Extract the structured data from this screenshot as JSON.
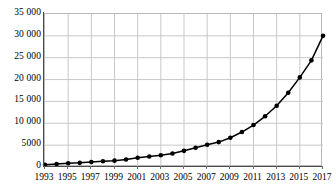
{
  "chart_data": {
    "type": "line",
    "title": "",
    "subtitle": "",
    "xlabel": "",
    "ylabel": "",
    "x": [
      1993,
      1994,
      1995,
      1996,
      1997,
      1998,
      1999,
      2000,
      2001,
      2002,
      2003,
      2004,
      2005,
      2006,
      2007,
      2008,
      2009,
      2010,
      2011,
      2012,
      2013,
      2014,
      2015,
      2016,
      2017
    ],
    "values": [
      500,
      700,
      850,
      950,
      1150,
      1300,
      1450,
      1700,
      2100,
      2400,
      2700,
      3100,
      3700,
      4400,
      5100,
      5700,
      6700,
      8000,
      9600,
      11600,
      14000,
      17000,
      20500,
      24400,
      30000
    ],
    "series": [
      {
        "name": "series-1",
        "values": [
          500,
          700,
          850,
          950,
          1150,
          1300,
          1450,
          1700,
          2100,
          2400,
          2700,
          3100,
          3700,
          4400,
          5100,
          5700,
          6700,
          8000,
          9600,
          11600,
          14000,
          17000,
          20500,
          24400,
          30000
        ]
      }
    ],
    "xlim": [
      1993,
      2017
    ],
    "ylim": [
      0,
      35000
    ],
    "ytick_values": [
      0,
      5000,
      10000,
      15000,
      20000,
      25000,
      30000,
      35000
    ],
    "ytick_labels": [
      "0",
      "5000",
      "10 000",
      "15 000",
      "20 000",
      "25 000",
      "30 000",
      "35 000"
    ],
    "xtick_values": [
      1993,
      1995,
      1997,
      1999,
      2001,
      2003,
      2005,
      2007,
      2009,
      2011,
      2013,
      2015,
      2017
    ],
    "xtick_labels": [
      "1993",
      "1995",
      "1997",
      "1999",
      "2001",
      "2003",
      "2005",
      "2007",
      "2009",
      "2011",
      "2013",
      "2015",
      "2017"
    ],
    "grid": true,
    "grid_axes": "both",
    "legend": false,
    "legend_position": "none",
    "marker": "circle",
    "marker_color": "#000000",
    "line_color": "#000000",
    "grid_color": "#c8c8c8",
    "axis_color": "#4a4a4a",
    "background_color": "#ffffff",
    "annotations": []
  }
}
